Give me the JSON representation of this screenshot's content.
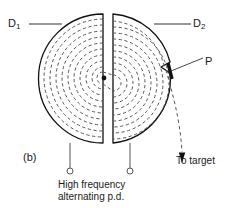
{
  "figure": {
    "caption": "(b)",
    "labels": {
      "dee_left": "D",
      "dee_left_sub": "1",
      "dee_right": "D",
      "dee_right_sub": "2",
      "deflector_plate": "P",
      "beam_exit": "To target",
      "supply_line1": "High frequency",
      "supply_line2": "alternating p.d."
    },
    "colors": {
      "background": "#ffffff",
      "ink": "#1a1a1a",
      "outline": "#111111",
      "dashed_path": "#555555",
      "leader": "#333333"
    }
  },
  "geometry": {
    "center_x": 108,
    "center_y": 78,
    "outer_radius": 64,
    "gap_left_x": 103,
    "gap_right_x": 113,
    "dee_top_y": 14,
    "dee_bottom_y": 143,
    "spiral_radii": [
      6,
      11,
      17,
      23,
      29,
      35,
      41,
      47,
      53,
      59
    ],
    "terminal_left_x": 70,
    "terminal_right_x": 130,
    "terminal_y": 172,
    "arrow_x": 182,
    "arrow_tip_y": 163
  },
  "elements": {
    "ion_source_dot": "ion-source",
    "left_dee": "dee-d1",
    "right_dee": "dee-d2",
    "deflector": "deflector-plate-p",
    "exit_beam": "exit-beam-path",
    "supply_terminals": [
      "terminal-left",
      "terminal-right"
    ]
  }
}
